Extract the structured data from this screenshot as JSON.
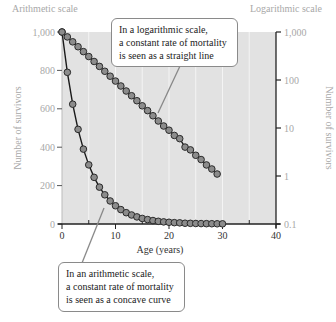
{
  "chart_data": {
    "type": "line",
    "title": "",
    "xlabel": "Age (years)",
    "left_axis": {
      "title": "Arithmetic scale",
      "ylabel": "Number of survivors",
      "ticks": [
        0,
        200,
        400,
        600,
        800,
        1000
      ],
      "tick_labels": [
        "0",
        "200",
        "400",
        "600",
        "800",
        "1,000"
      ],
      "ylim": [
        0,
        1000
      ]
    },
    "right_axis": {
      "title": "Logarithmic scale",
      "ylabel": "Number of survivors",
      "ticks": [
        0.1,
        1,
        10,
        100,
        1000
      ],
      "tick_labels": [
        "0.1",
        "1",
        "10",
        "100",
        "1,000"
      ],
      "ylim": [
        0.1,
        1000
      ],
      "scale": "log"
    },
    "x_ticks": [
      0,
      10,
      20,
      30,
      40
    ],
    "x_minor_ticks": [
      5,
      15,
      25,
      35
    ],
    "xlim": [
      0,
      40
    ],
    "grid": "vertical every 5 years",
    "series": [
      {
        "name": "Arithmetic scale survivors",
        "axis": "left",
        "x": [
          0,
          1,
          2,
          3,
          4,
          5,
          6,
          7,
          8,
          9,
          10,
          11,
          12,
          13,
          14,
          15,
          16,
          17,
          18,
          19,
          20,
          21,
          22,
          23,
          24,
          25,
          26,
          27,
          28,
          29,
          30
        ],
        "values": [
          1000,
          790,
          624,
          493,
          390,
          308,
          243,
          192,
          152,
          120,
          95,
          75,
          59,
          47,
          37,
          29,
          23,
          18,
          14,
          11,
          9,
          7,
          6,
          4,
          3.5,
          2.7,
          2.2,
          1.7,
          1.4,
          1.1,
          0.85
        ]
      },
      {
        "name": "Logarithmic scale survivors",
        "axis": "right",
        "x": [
          0,
          1,
          2,
          3,
          4,
          5,
          6,
          7,
          8,
          9,
          10,
          11,
          12,
          13,
          14,
          15,
          16,
          17,
          18,
          19,
          20,
          21,
          22,
          23,
          24,
          25,
          26,
          27,
          28,
          29
        ],
        "values": [
          1000,
          790,
          624,
          493,
          390,
          308,
          243,
          192,
          152,
          120,
          95,
          75,
          59,
          47,
          37,
          29,
          23,
          18,
          14,
          11,
          9,
          7,
          6,
          4,
          3.5,
          2.7,
          2.2,
          1.7,
          1.4,
          1.1
        ]
      }
    ],
    "annotations": [
      {
        "lines": [
          "In a logarithmic scale,",
          "a constant rate of mortality",
          "is seen as a straight line"
        ],
        "points_to": "log series"
      },
      {
        "lines": [
          "In an arithmetic scale,",
          "a constant rate of mortality",
          "is seen as a concave curve"
        ],
        "points_to": "arithmetic series"
      }
    ],
    "colors": {
      "plot_bg": "#e2e2e2",
      "marker_fill": "#8c8c8c",
      "marker_stroke": "#2a2a2a",
      "line": "#1a1a1a",
      "grid": "#f4f4f4",
      "leader": "#888888"
    }
  }
}
